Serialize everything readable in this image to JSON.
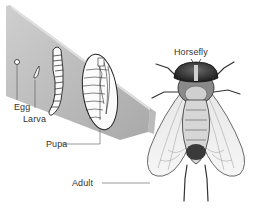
{
  "figure": {
    "subject_label": "Horsefly",
    "stages": [
      {
        "id": "egg",
        "label": "Egg"
      },
      {
        "id": "larva",
        "label": "Larva"
      },
      {
        "id": "pupa",
        "label": "Pupa"
      },
      {
        "id": "adult",
        "label": "Adult"
      }
    ]
  },
  "colors": {
    "background": "#ffffff",
    "panel_face": "#b9b9b9",
    "panel_edge": "#8e8e8e",
    "ink": "#222222",
    "label_text": "#333333",
    "leader_line": "#555555"
  }
}
